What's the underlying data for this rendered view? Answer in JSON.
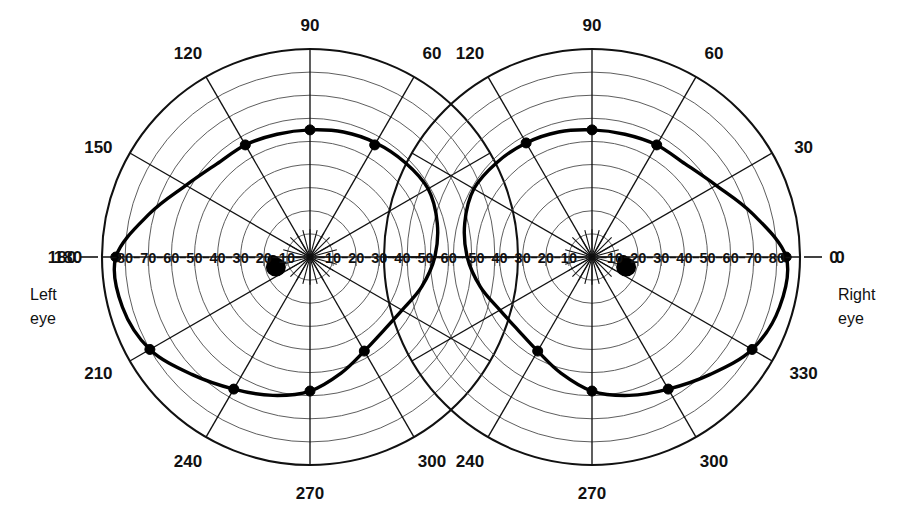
{
  "figure": {
    "background_color": "#ffffff",
    "ink_color": "#111111",
    "grid_color": "#555555",
    "isopter_color": "#000000"
  },
  "labels": {
    "left_eye": "Left\neye",
    "left_eye_line1": "Left",
    "left_eye_line2": "eye",
    "right_eye_line1": "Right",
    "right_eye_line2": "eye"
  },
  "chart_data": {
    "type": "line",
    "subtype": "polar-isopter",
    "xlabel": "",
    "ylabel": "",
    "grid": true,
    "legend_position": "none",
    "radial_axis": {
      "units": "degrees of eccentricity",
      "min": 0,
      "max": 90,
      "ring_step": 10,
      "ring_values": [
        10,
        20,
        30,
        40,
        50,
        60,
        70,
        80,
        90
      ],
      "meridian_step": 30
    },
    "panels": [
      {
        "name": "left-eye",
        "eye_label_line1": "Left",
        "eye_label_line2": "eye",
        "center_px": [
          310,
          257
        ],
        "radius_px": 208,
        "meridian_labels": [
          "180",
          "150",
          "120",
          "90",
          "60",
          "30",
          "0",
          "330",
          "300",
          "270",
          "240",
          "210"
        ],
        "meridian_angles": [
          180,
          150,
          120,
          90,
          60,
          30,
          0,
          330,
          300,
          270,
          240,
          210
        ],
        "visible_meridian_labels": [
          "180",
          "150",
          "120",
          "90",
          "60",
          "210",
          "240",
          "270",
          "300"
        ],
        "horizontal_tick_labels_left": [
          "80",
          "70",
          "60",
          "50",
          "40",
          "30",
          "20",
          "10"
        ],
        "horizontal_tick_labels_right": [
          "10",
          "20",
          "30",
          "40",
          "50",
          "60"
        ],
        "outer_boundary_label": "180",
        "isopter": {
          "name": "I4e isopter",
          "angles_deg": [
            0,
            15,
            30,
            45,
            60,
            75,
            90,
            105,
            120,
            135,
            150,
            165,
            180,
            195,
            210,
            225,
            240,
            255,
            270,
            285,
            300,
            315,
            330,
            345
          ],
          "radii_deg": [
            54,
            57,
            59,
            58,
            57,
            56,
            55,
            55,
            56,
            57,
            62,
            72,
            84,
            84,
            80,
            72,
            66,
            62,
            58,
            52,
            47,
            45,
            46,
            50
          ]
        },
        "marked_points": [
          {
            "angle_deg": 90,
            "radius_deg": 55
          },
          {
            "angle_deg": 120,
            "radius_deg": 56
          },
          {
            "angle_deg": 60,
            "radius_deg": 56
          },
          {
            "angle_deg": 180,
            "radius_deg": 84
          },
          {
            "angle_deg": 210,
            "radius_deg": 80
          },
          {
            "angle_deg": 240,
            "radius_deg": 66
          },
          {
            "angle_deg": 270,
            "radius_deg": 58
          },
          {
            "angle_deg": 300,
            "radius_deg": 47
          }
        ],
        "blind_spot": {
          "angle_deg": 190,
          "radius_deg": 15,
          "label": "physiological blind spot"
        }
      },
      {
        "name": "right-eye",
        "eye_label_line1": "Right",
        "eye_label_line2": "eye",
        "center_px": [
          592,
          257
        ],
        "radius_px": 208,
        "meridian_labels": [
          "180",
          "150",
          "120",
          "90",
          "60",
          "30",
          "0",
          "330",
          "300",
          "270",
          "240",
          "210"
        ],
        "meridian_angles": [
          180,
          150,
          120,
          90,
          60,
          30,
          0,
          330,
          300,
          270,
          240,
          210
        ],
        "visible_meridian_labels": [
          "120",
          "90",
          "60",
          "30",
          "0",
          "330",
          "300",
          "270",
          "240"
        ],
        "horizontal_tick_labels_left": [
          "50",
          "40",
          "30",
          "20",
          "10"
        ],
        "horizontal_tick_labels_right": [
          "10",
          "20",
          "30",
          "40",
          "50",
          "60",
          "70",
          "80"
        ],
        "outer_boundary_label": "0",
        "isopter": {
          "name": "I4e isopter",
          "angles_deg": [
            0,
            15,
            30,
            45,
            60,
            75,
            90,
            105,
            120,
            135,
            150,
            165,
            180,
            195,
            210,
            225,
            240,
            255,
            270,
            285,
            300,
            315,
            330,
            345
          ],
          "radii_deg": [
            84,
            72,
            62,
            57,
            56,
            55,
            55,
            56,
            57,
            58,
            59,
            57,
            54,
            50,
            46,
            45,
            47,
            52,
            58,
            62,
            66,
            72,
            80,
            84
          ]
        },
        "marked_points": [
          {
            "angle_deg": 90,
            "radius_deg": 55
          },
          {
            "angle_deg": 120,
            "radius_deg": 57
          },
          {
            "angle_deg": 60,
            "radius_deg": 56
          },
          {
            "angle_deg": 0,
            "radius_deg": 84
          },
          {
            "angle_deg": 330,
            "radius_deg": 80
          },
          {
            "angle_deg": 300,
            "radius_deg": 66
          },
          {
            "angle_deg": 270,
            "radius_deg": 58
          },
          {
            "angle_deg": 240,
            "radius_deg": 47
          }
        ],
        "blind_spot": {
          "angle_deg": 350,
          "radius_deg": 15,
          "label": "physiological blind spot"
        }
      }
    ]
  }
}
